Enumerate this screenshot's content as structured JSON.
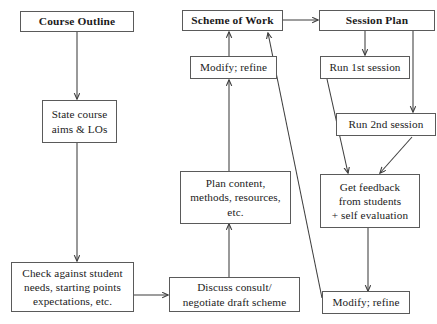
{
  "diagram": {
    "type": "flowchart",
    "canvas": {
      "width": 437,
      "height": 324
    },
    "colors": {
      "box_border": "#5a5a5a",
      "arrow": "#3d3d3d",
      "background": "#ffffff",
      "text": "#1b1b1b"
    },
    "nodes": [
      {
        "id": "course-outline",
        "label": "Course Outline"
      },
      {
        "id": "scheme-of-work",
        "label": "Scheme of Work"
      },
      {
        "id": "session-plan",
        "label": "Session Plan"
      },
      {
        "id": "modify-refine-top",
        "label": "Modify; refine"
      },
      {
        "id": "run-1st-session",
        "label": "Run 1st session"
      },
      {
        "id": "state-course-aims",
        "label": "State course\naims & LOs"
      },
      {
        "id": "run-2nd-session",
        "label": "Run 2nd session"
      },
      {
        "id": "plan-content",
        "label": "Plan content,\nmethods, resources,\netc."
      },
      {
        "id": "get-feedback",
        "label": "Get feedback\nfrom students\n+ self evaluation"
      },
      {
        "id": "check-against",
        "label": "Check against student\nneeds, starting points\nexpectations, etc."
      },
      {
        "id": "discuss-consult",
        "label": "Discuss consult/\nnegotiate draft scheme"
      },
      {
        "id": "modify-refine-bottom",
        "label": "Modify; refine"
      }
    ],
    "edges": [
      {
        "from": "course-outline",
        "to": "state-course-aims",
        "style": "straight-down"
      },
      {
        "from": "state-course-aims",
        "to": "check-against",
        "style": "straight-down"
      },
      {
        "from": "check-against",
        "to": "discuss-consult",
        "style": "straight-right"
      },
      {
        "from": "discuss-consult",
        "to": "plan-content",
        "style": "straight-up"
      },
      {
        "from": "plan-content",
        "to": "modify-refine-top",
        "style": "straight-up"
      },
      {
        "from": "modify-refine-top",
        "to": "scheme-of-work",
        "style": "straight-up"
      },
      {
        "from": "scheme-of-work",
        "to": "session-plan",
        "style": "straight-right"
      },
      {
        "from": "session-plan",
        "to": "run-1st-session",
        "style": "straight-down"
      },
      {
        "from": "session-plan",
        "to": "run-2nd-session",
        "style": "right-channel-down"
      },
      {
        "from": "run-1st-session",
        "to": "get-feedback",
        "style": "diagonal-down-right"
      },
      {
        "from": "run-2nd-session",
        "to": "get-feedback",
        "style": "diagonal-down-left"
      },
      {
        "from": "get-feedback",
        "to": "modify-refine-bottom",
        "style": "straight-down"
      },
      {
        "from": "modify-refine-bottom",
        "to": "scheme-of-work",
        "style": "diagonal-up-left"
      }
    ]
  }
}
